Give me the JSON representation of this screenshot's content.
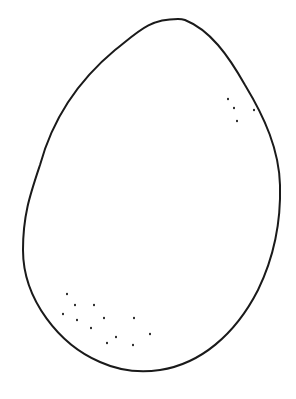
{
  "drawing": {
    "subject": "egg",
    "style": "line-drawing",
    "background": "#ffffff",
    "stroke_color": "#1a1a1a",
    "stroke_width": 2,
    "outline_path": "M178 19 C 150 19, 140 30, 115 50 C 85 75, 55 110, 40 165 C 30 195, 23 215, 23 250 C 23 300, 60 345, 100 362 C 120 371, 140 373, 160 370 C 200 364, 235 335, 258 290 C 275 255, 281 220, 280 185 C 279 150, 265 118, 245 85 C 228 55, 210 30, 185 20 C 182 19, 180 19, 178 19 Z",
    "speckles_upper_right": [
      [
        228,
        99
      ],
      [
        234,
        108
      ],
      [
        254,
        110
      ],
      [
        237,
        121
      ]
    ],
    "speckles_lower_left": [
      [
        67,
        294
      ],
      [
        75,
        305
      ],
      [
        94,
        305
      ],
      [
        63,
        314
      ],
      [
        77,
        320
      ],
      [
        104,
        318
      ],
      [
        134,
        318
      ],
      [
        91,
        328
      ],
      [
        116,
        337
      ],
      [
        150,
        334
      ],
      [
        107,
        343
      ],
      [
        133,
        345
      ]
    ]
  }
}
